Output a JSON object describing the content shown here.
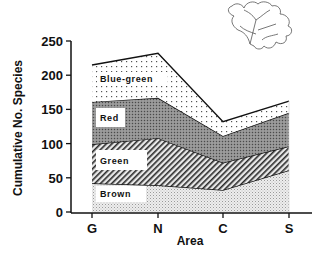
{
  "chart_data": {
    "type": "area",
    "stacked": true,
    "title": "",
    "xlabel": "Area",
    "ylabel": "Cumulative No. Species",
    "categories": [
      "G",
      "N",
      "C",
      "S"
    ],
    "ylim": [
      0,
      250
    ],
    "yticks": [
      0,
      50,
      100,
      150,
      200,
      250
    ],
    "grid": false,
    "legend": "inline labels on bands",
    "cumulative_tops": {
      "Brown": [
        42,
        39,
        32,
        61
      ],
      "Green": [
        99,
        108,
        72,
        96
      ],
      "Red": [
        161,
        167,
        111,
        145
      ],
      "Blue-green": [
        215,
        232,
        132,
        162
      ]
    },
    "series": [
      {
        "name": "Brown",
        "values": [
          42,
          39,
          32,
          61
        ],
        "fill": "light stipple"
      },
      {
        "name": "Green",
        "values": [
          57,
          69,
          40,
          35
        ],
        "fill": "diagonal hatch"
      },
      {
        "name": "Red",
        "values": [
          62,
          59,
          39,
          49
        ],
        "fill": "dark stipple"
      },
      {
        "name": "Blue-green",
        "values": [
          54,
          65,
          21,
          17
        ],
        "fill": "sparse dots"
      }
    ],
    "annotations": [
      "seaweed (algae) line drawing in upper right"
    ]
  },
  "labels": {
    "band_brown": "Brown",
    "band_green": "Green",
    "band_red": "Red",
    "band_bluegreen": "Blue-green",
    "xlabel": "Area",
    "ylabel": "Cumulative No. Species",
    "xticks": [
      "G",
      "N",
      "C",
      "S"
    ],
    "yticks": [
      "0",
      "50",
      "100",
      "150",
      "200",
      "250"
    ]
  },
  "icons": {
    "illustration": "seaweed-drawing"
  }
}
